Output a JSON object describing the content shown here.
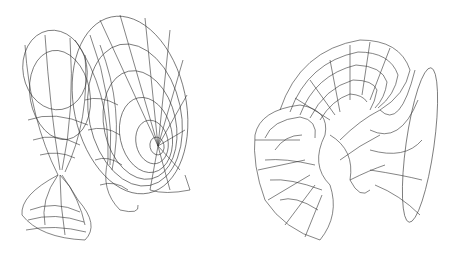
{
  "figures": [
    {
      "id": "left",
      "description": "Wireframe minimal surface with two trumpet-shaped flared ends intersecting, viewed from side",
      "line_color": "#333333",
      "background": "#ffffff"
    },
    {
      "id": "right",
      "description": "Wireframe minimal surface with large curled flared end and trumpet end, viewed from front",
      "line_color": "#333333",
      "background": "#ffffff"
    }
  ]
}
